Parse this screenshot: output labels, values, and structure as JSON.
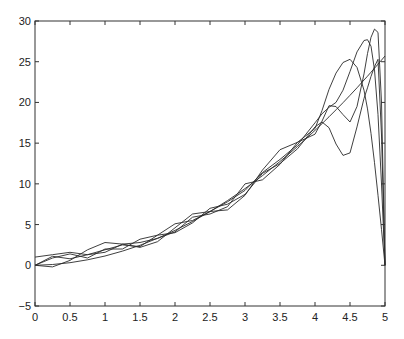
{
  "chart_data": {
    "type": "line",
    "title": "",
    "xlabel": "",
    "ylabel": "",
    "xlim": [
      0,
      5
    ],
    "ylim": [
      -5,
      30
    ],
    "grid": false,
    "legend": null,
    "x_ticks": [
      "0",
      "0.5",
      "1",
      "1.5",
      "2",
      "2.5",
      "3",
      "3.5",
      "4",
      "4.5",
      "5"
    ],
    "y_ticks": [
      "-5",
      "0",
      "5",
      "10",
      "15",
      "20",
      "25",
      "30"
    ],
    "x": [
      0,
      0.25,
      0.5,
      0.75,
      1,
      1.25,
      1.5,
      1.75,
      2,
      2.25,
      2.5,
      2.75,
      3,
      3.25,
      3.5,
      3.75,
      4,
      4.1,
      4.2,
      4.3,
      4.4,
      4.5,
      4.6,
      4.7,
      4.75,
      4.8,
      4.85,
      4.9,
      4.95,
      5
    ],
    "series": [
      {
        "name": "target",
        "values": [
          0,
          0.1,
          0.32,
          0.67,
          1.14,
          1.74,
          2.46,
          3.31,
          4.28,
          5.38,
          6.6,
          7.95,
          9.42,
          11.02,
          12.74,
          14.59,
          16.56,
          17.39,
          18.23,
          19.09,
          19.97,
          20.88,
          21.8,
          22.75,
          23.22,
          23.71,
          24.2,
          24.7,
          25.2,
          25.7
        ]
      },
      {
        "name": "approx-1",
        "values": [
          0,
          -0.2,
          0.6,
          1.9,
          2.8,
          2.6,
          2.2,
          2.9,
          4.6,
          6.3,
          6.6,
          6.8,
          8.6,
          11.7,
          14.2,
          15.1,
          16.8,
          19.0,
          21.6,
          23.6,
          24.9,
          25.3,
          24.3,
          21.5,
          19.2,
          16.2,
          12.6,
          8.6,
          4.4,
          0
        ]
      },
      {
        "name": "approx-2",
        "values": [
          1.0,
          1.3,
          1.6,
          1.3,
          1.9,
          2.5,
          2.3,
          3.7,
          5.1,
          5.5,
          6.6,
          7.8,
          9.2,
          11.4,
          13.0,
          14.8,
          17.5,
          18.6,
          19.4,
          20.0,
          21.5,
          23.8,
          26.2,
          27.6,
          27.7,
          26.9,
          24.0,
          18.5,
          10.0,
          0
        ]
      },
      {
        "name": "approx-3",
        "values": [
          0,
          1.1,
          0.8,
          1.3,
          1.6,
          2.6,
          2.8,
          3.3,
          4.1,
          5.9,
          6.3,
          7.2,
          10.0,
          10.5,
          12.4,
          15.1,
          16.1,
          17.7,
          19.6,
          19.5,
          18.5,
          17.6,
          19.5,
          23.5,
          26.0,
          28.0,
          29.0,
          28.6,
          20.0,
          0
        ]
      },
      {
        "name": "approx-4",
        "values": [
          0,
          0.9,
          1.4,
          0.9,
          2.0,
          2.0,
          3.2,
          3.7,
          4.0,
          5.2,
          7.0,
          7.5,
          8.7,
          11.3,
          12.5,
          14.3,
          17.0,
          17.6,
          16.9,
          14.9,
          13.5,
          13.8,
          17.0,
          20.5,
          21.8,
          23.2,
          24.4,
          25.3,
          16.0,
          0
        ]
      }
    ]
  }
}
